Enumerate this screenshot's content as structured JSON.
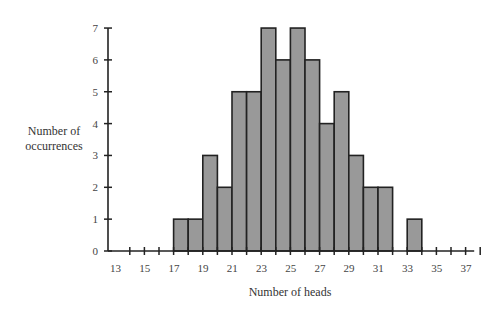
{
  "chart_data": {
    "type": "bar",
    "title": "",
    "xlabel": "Number of heads",
    "ylabel": "Number of occurrences",
    "x": [
      13,
      14,
      15,
      16,
      17,
      18,
      19,
      20,
      21,
      22,
      23,
      24,
      25,
      26,
      27,
      28,
      29,
      30,
      31,
      32,
      33,
      34,
      35,
      36,
      37
    ],
    "values": [
      0,
      0,
      0,
      0,
      1,
      1,
      3,
      2,
      5,
      5,
      7,
      6,
      7,
      6,
      4,
      5,
      3,
      2,
      2,
      0,
      1,
      0,
      0,
      0,
      0
    ],
    "x_tick_labels": [
      "13",
      "15",
      "17",
      "19",
      "21",
      "23",
      "25",
      "27",
      "29",
      "31",
      "33",
      "35",
      "37"
    ],
    "y_tick_labels": [
      "0",
      "1",
      "2",
      "3",
      "4",
      "5",
      "6",
      "7"
    ],
    "ylim": [
      0,
      7
    ],
    "xlim": [
      13,
      37
    ],
    "grid": false,
    "legend": null,
    "bar_color": "#999999",
    "edge_color": "#222222"
  },
  "labels": {
    "ylabel_line1": "Number of",
    "ylabel_line2": "occurrences",
    "xlabel": "Number of heads"
  }
}
